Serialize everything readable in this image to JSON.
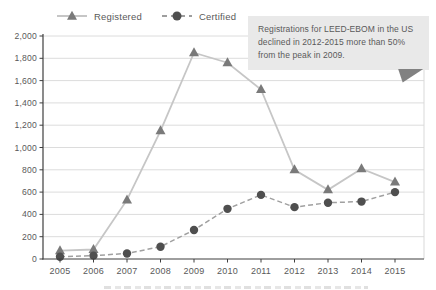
{
  "legend": {
    "items": [
      {
        "label": "Registered",
        "marker": "triangle-icon"
      },
      {
        "label": "Certified",
        "marker": "circle-icon"
      }
    ]
  },
  "callout": {
    "text": "Registrations for LEED-EBOM in the US declined in 2012-2015 more than 50% from the peak in 2009.",
    "background": "#e9e9e9",
    "fold_color": "#818181",
    "text_color": "#595959"
  },
  "colors": {
    "background": "#ffffff",
    "axis": "#3f3f3f",
    "grid": "#dcdcdc",
    "plot_right_border": "#d9d9d9",
    "tick_label": "#595959"
  },
  "chart_data": {
    "type": "line",
    "title": "",
    "xlabel": "",
    "ylabel": "",
    "categories": [
      "2005",
      "2006",
      "2007",
      "2008",
      "2009",
      "2010",
      "2011",
      "2012",
      "2013",
      "2014",
      "2015"
    ],
    "series": [
      {
        "name": "Registered",
        "marker": "triangle",
        "line_style": "solid",
        "line_color": "#c6c6c6",
        "marker_color": "#7a7a7a",
        "values": [
          75,
          85,
          530,
          1150,
          1850,
          1760,
          1520,
          800,
          620,
          810,
          690
        ]
      },
      {
        "name": "Certified",
        "marker": "circle",
        "line_style": "dashed",
        "line_color": "#a0a0a0",
        "marker_color": "#4f4f4f",
        "values": [
          20,
          30,
          50,
          110,
          260,
          450,
          575,
          465,
          505,
          515,
          600
        ]
      }
    ],
    "ylim": [
      0,
      2000
    ],
    "ytick_step": 200,
    "ytick_labels": [
      "0",
      "200",
      "400",
      "600",
      "800",
      "1,000",
      "1,200",
      "1,400",
      "1,600",
      "1,800",
      "2,000"
    ],
    "grid": "horizontal",
    "legend_position": "top-left",
    "annotation": "Registrations for LEED-EBOM in the US declined in 2012-2015 more than 50% from the peak in 2009."
  }
}
